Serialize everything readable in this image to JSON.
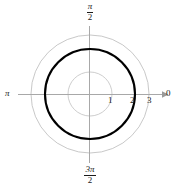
{
  "figure": {
    "background_color": "#ffffff",
    "width": 177,
    "height": 189
  },
  "labels": {
    "angle_right": "0",
    "angle_left_pi": "π",
    "angle_top_numerator": "π",
    "angle_top_denominator": "2",
    "angle_bottom_numerator": "3π",
    "angle_bottom_denominator": "2",
    "radial_tick_1": "1",
    "radial_tick_2": "2",
    "radial_tick_3": "3"
  },
  "colors": {
    "grid": "#b0b0b0",
    "axis": "#a8a8a8",
    "curve": "#000000",
    "text": "#1a1a1a"
  },
  "chart_data": {
    "type": "line",
    "coordinate_system": "polar",
    "title": "",
    "xlabel": "",
    "ylabel": "",
    "center_px": [
      90,
      94
    ],
    "px_per_unit": 22,
    "rlim": [
      0,
      3
    ],
    "grid": true,
    "legend_position": "none",
    "radial_ticks": [
      1,
      2,
      3
    ],
    "radial_tick_labels": [
      "1",
      "2",
      "3"
    ],
    "angular_tick_labels": [
      "0",
      "π/2",
      "π",
      "3π/2"
    ],
    "angular_ticks_deg": [
      0,
      90,
      180,
      270
    ],
    "grid_circles": [
      {
        "r": 1,
        "radius_px": 22,
        "stroke": "#b8b8b8",
        "width": 0.7
      },
      {
        "r": 2,
        "radius_px": 45,
        "stroke": "#b0b0b0",
        "width": 0.7
      },
      {
        "r": 3,
        "radius_px": 59,
        "stroke": "#b0b0b0",
        "width": 0.7
      }
    ],
    "series": [
      {
        "name": "r = 2",
        "equation": "r = 2",
        "shape": "circle",
        "r_constant": 2,
        "radius_px": 45,
        "theta_range_deg": [
          0,
          360
        ],
        "stroke": "#000000",
        "width": 2.1,
        "emphasis": "bold"
      }
    ],
    "annotations": [
      {
        "text": "1",
        "x_px": 111,
        "y_px": 99,
        "role": "radial-tick-label"
      },
      {
        "text": "2",
        "x_px": 133,
        "y_px": 99,
        "role": "radial-tick-label"
      },
      {
        "text": "3",
        "x_px": 150,
        "y_px": 99,
        "role": "radial-tick-label"
      }
    ]
  }
}
